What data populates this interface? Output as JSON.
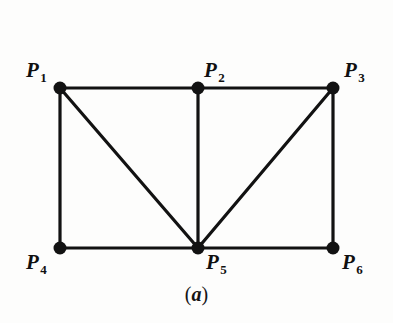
{
  "figure": {
    "caption": "(a)",
    "caption_open_paren": "(",
    "caption_letter": "a",
    "caption_close_paren": ")",
    "background_color": "#fdfdfc",
    "ink_color": "#121212"
  },
  "chart_data": {
    "type": "diagram",
    "title": "(a)",
    "xlabel": "",
    "ylabel": "",
    "nodes": [
      {
        "id": "P1",
        "label_base": "P",
        "label_sub": "1",
        "x": 60,
        "y": 88,
        "label_x": 26,
        "label_y": 60,
        "label_anchor": "upper-left"
      },
      {
        "id": "P2",
        "label_base": "P",
        "label_sub": "2",
        "x": 198,
        "y": 88,
        "label_x": 204,
        "label_y": 60,
        "label_anchor": "upper-right"
      },
      {
        "id": "P3",
        "label_base": "P",
        "label_sub": "3",
        "x": 333,
        "y": 88,
        "label_x": 344,
        "label_y": 60,
        "label_anchor": "upper-right"
      },
      {
        "id": "P4",
        "label_base": "P",
        "label_sub": "4",
        "x": 60,
        "y": 248,
        "label_x": 26,
        "label_y": 252,
        "label_anchor": "lower-left"
      },
      {
        "id": "P5",
        "label_base": "P",
        "label_sub": "5",
        "x": 198,
        "y": 248,
        "label_x": 206,
        "label_y": 252,
        "label_anchor": "lower-right"
      },
      {
        "id": "P6",
        "label_base": "P",
        "label_sub": "6",
        "x": 333,
        "y": 248,
        "label_x": 342,
        "label_y": 252,
        "label_anchor": "lower-right"
      }
    ],
    "edges": [
      {
        "from": "P1",
        "to": "P2",
        "name": "edge-p1-p2"
      },
      {
        "from": "P2",
        "to": "P3",
        "name": "edge-p2-p3"
      },
      {
        "from": "P1",
        "to": "P4",
        "name": "edge-p1-p4"
      },
      {
        "from": "P3",
        "to": "P6",
        "name": "edge-p3-p6"
      },
      {
        "from": "P4",
        "to": "P5",
        "name": "edge-p4-p5"
      },
      {
        "from": "P5",
        "to": "P6",
        "name": "edge-p5-p6"
      },
      {
        "from": "P2",
        "to": "P5",
        "name": "edge-p2-p5"
      },
      {
        "from": "P1",
        "to": "P5",
        "name": "edge-p1-p5"
      },
      {
        "from": "P5",
        "to": "P3",
        "name": "edge-p5-p3"
      }
    ],
    "node_radius": 6.5,
    "edge_width": 3.2,
    "node_count": 6,
    "edge_count": 9
  }
}
